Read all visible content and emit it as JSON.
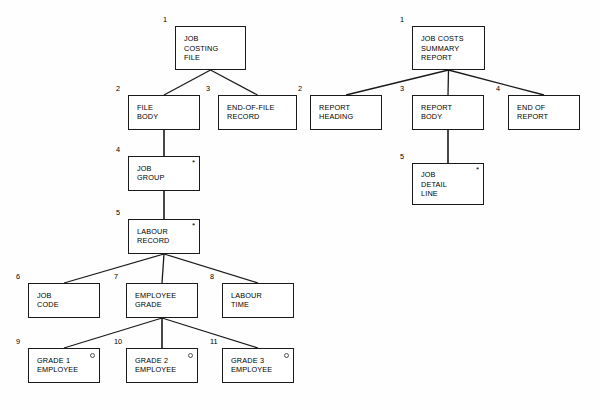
{
  "diagram": {
    "type": "jackson-structure-diagram",
    "colors": {
      "background": "#fefefe",
      "line": "#1a1a1a",
      "text": "#000000",
      "marker": "#555555"
    },
    "markers": {
      "iteration": "*",
      "selection": "○"
    },
    "trees": [
      {
        "name": "job-costing-file",
        "nodes": [
          {
            "id": "l1",
            "seq": "1",
            "label": "JOB\nCOSTING\nFILE",
            "marker": "",
            "x": 175,
            "y": 26,
            "w": 71,
            "h": 44
          },
          {
            "id": "l2",
            "seq": "2",
            "label": "FILE\nBODY",
            "marker": "",
            "x": 128,
            "y": 95,
            "w": 72,
            "h": 35
          },
          {
            "id": "l3",
            "seq": "3",
            "label": "END-OF-FILE\nRECORD",
            "marker": "",
            "x": 218,
            "y": 95,
            "w": 79,
            "h": 35
          },
          {
            "id": "l4",
            "seq": "4",
            "label": "JOB\nGROUP",
            "marker": "*",
            "x": 128,
            "y": 156,
            "w": 72,
            "h": 35
          },
          {
            "id": "l5",
            "seq": "5",
            "label": "LABOUR\nRECORD",
            "marker": "*",
            "x": 128,
            "y": 219,
            "w": 72,
            "h": 35
          },
          {
            "id": "l6",
            "seq": "6",
            "label": "JOB\nCODE",
            "marker": "",
            "x": 28,
            "y": 283,
            "w": 72,
            "h": 35
          },
          {
            "id": "l7",
            "seq": "7",
            "label": "EMPLOYEE\nGRADE",
            "marker": "",
            "x": 126,
            "y": 283,
            "w": 72,
            "h": 35
          },
          {
            "id": "l8",
            "seq": "8",
            "label": "LABOUR\nTIME",
            "marker": "",
            "x": 222,
            "y": 283,
            "w": 72,
            "h": 35
          },
          {
            "id": "l9",
            "seq": "9",
            "label": "GRADE 1\nEMPLOYEE",
            "marker": "○",
            "x": 28,
            "y": 348,
            "w": 72,
            "h": 35
          },
          {
            "id": "l10",
            "seq": "10",
            "label": "GRADE 2\nEMPLOYEE",
            "marker": "○",
            "x": 126,
            "y": 348,
            "w": 72,
            "h": 35
          },
          {
            "id": "l11",
            "seq": "11",
            "label": "GRADE 3\nEMPLOYEE",
            "marker": "○",
            "x": 222,
            "y": 348,
            "w": 72,
            "h": 35
          }
        ],
        "edges": [
          [
            "l1",
            "l2"
          ],
          [
            "l1",
            "l3"
          ],
          [
            "l2",
            "l4"
          ],
          [
            "l4",
            "l5"
          ],
          [
            "l5",
            "l6"
          ],
          [
            "l5",
            "l7"
          ],
          [
            "l5",
            "l8"
          ],
          [
            "l7",
            "l9"
          ],
          [
            "l7",
            "l10"
          ],
          [
            "l7",
            "l11"
          ]
        ]
      },
      {
        "name": "job-costs-summary-report",
        "nodes": [
          {
            "id": "r1",
            "seq": "1",
            "label": "JOB COSTS\nSUMMARY\nREPORT",
            "marker": "",
            "x": 412,
            "y": 26,
            "w": 73,
            "h": 44
          },
          {
            "id": "r2",
            "seq": "2",
            "label": "REPORT\nHEADING",
            "marker": "",
            "x": 310,
            "y": 95,
            "w": 72,
            "h": 35
          },
          {
            "id": "r3",
            "seq": "3",
            "label": "REPORT\nBODY",
            "marker": "",
            "x": 412,
            "y": 95,
            "w": 72,
            "h": 35
          },
          {
            "id": "r4",
            "seq": "4",
            "label": "END OF\nREPORT",
            "marker": "",
            "x": 508,
            "y": 95,
            "w": 72,
            "h": 35
          },
          {
            "id": "r5",
            "seq": "5",
            "label": "JOB\nDETAIL\nLINE",
            "marker": "*",
            "x": 412,
            "y": 163,
            "w": 72,
            "h": 42
          }
        ],
        "edges": [
          [
            "r1",
            "r2"
          ],
          [
            "r1",
            "r3"
          ],
          [
            "r1",
            "r4"
          ],
          [
            "r3",
            "r5"
          ]
        ]
      }
    ]
  }
}
